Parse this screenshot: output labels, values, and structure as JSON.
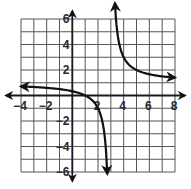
{
  "chart_data": {
    "type": "line",
    "title": "",
    "xlabel": "",
    "ylabel": "",
    "function": "y = 1 + 2/(x - 3)",
    "vertical_asymptote": 3,
    "horizontal_asymptote": 1,
    "xlim": [
      -4,
      8
    ],
    "ylim": [
      -6,
      6
    ],
    "grid": true,
    "grid_step": 1,
    "x_ticks": [
      -4,
      -2,
      2,
      4,
      6,
      8
    ],
    "x_tick_labels": [
      "−4",
      "−2",
      "2",
      "4",
      "6",
      "8"
    ],
    "y_ticks": [
      6,
      4,
      2,
      -2,
      -4,
      -6
    ],
    "y_tick_labels": [
      "6",
      "4",
      "2",
      "−2",
      "−4",
      "−6"
    ],
    "series": [
      {
        "name": "left-branch",
        "x": [
          -4,
          -2,
          0,
          1,
          2,
          2.5,
          2.65
        ],
        "y": [
          0.71,
          0.6,
          0.33,
          0,
          -1,
          -3,
          -4.7
        ],
        "arrows": "both"
      },
      {
        "name": "right-branch",
        "x": [
          3.35,
          3.5,
          4,
          5,
          6,
          7,
          8
        ],
        "y": [
          6.7,
          5,
          3,
          2,
          1.67,
          1.5,
          1.4
        ],
        "arrows": "both"
      }
    ]
  },
  "colors": {
    "grid": "#555555",
    "axis": "#1a1a1a",
    "curve": "#111111",
    "background": "#ffffff"
  }
}
